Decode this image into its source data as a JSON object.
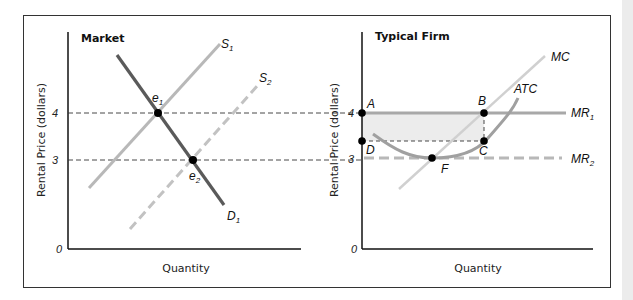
{
  "figure": {
    "panels": [
      {
        "title": "Market",
        "ylabel": "Rental Price (dollars)",
        "xlabel": "Quantity",
        "yticks": [
          "0",
          "3",
          "4"
        ],
        "curves": {
          "demand": "D",
          "demand_sub": "1",
          "supply1": "S",
          "supply1_sub": "1",
          "supply2": "S",
          "supply2_sub": "2"
        },
        "points": {
          "e1": "e",
          "e1_sub": "1",
          "e2": "e",
          "e2_sub": "2"
        }
      },
      {
        "title": "Typical Firm",
        "ylabel": "Rental Price (dollars)",
        "xlabel": "Quantity",
        "yticks": [
          "0",
          "3",
          "4"
        ],
        "curves": {
          "mc": "MC",
          "atc": "ATC",
          "mr1": "MR",
          "mr1_sub": "1",
          "mr2": "MR",
          "mr2_sub": "2"
        },
        "points": {
          "a": "A",
          "b": "B",
          "c": "C",
          "d": "D",
          "f": "F"
        }
      }
    ],
    "colors": {
      "demand": "#5a5a5a",
      "supply": "#b8b8b8",
      "mr": "#a8a8a8",
      "profit_area": "#ececec",
      "axis": "#111111"
    }
  }
}
